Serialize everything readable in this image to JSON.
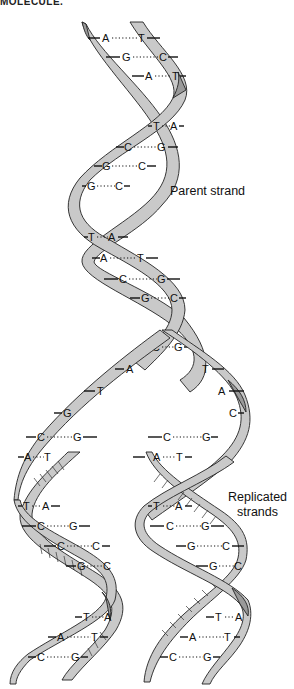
{
  "caption": "MOLECULE.",
  "labels": {
    "parent": "Parent strand",
    "replicated_line1": "Replicated",
    "replicated_line2": "strands"
  },
  "parent_pairs": [
    {
      "left": "A",
      "right": "T"
    },
    {
      "left": "G",
      "right": "C"
    },
    {
      "left": "A",
      "right": "T"
    },
    {
      "left": "T",
      "right": "A"
    },
    {
      "left": "C",
      "right": "G"
    },
    {
      "left": "G",
      "right": "C"
    },
    {
      "left": "G",
      "right": "C"
    },
    {
      "left": "T",
      "right": "A"
    },
    {
      "left": "A",
      "right": "T"
    },
    {
      "left": "C",
      "right": "G"
    },
    {
      "left": "G",
      "right": "C"
    },
    {
      "left": "C",
      "right": "G"
    }
  ],
  "unpaired_left": [
    "A",
    "T",
    "G"
  ],
  "unpaired_right": [
    "T",
    "A",
    "C"
  ],
  "fork_pairs": {
    "left": {
      "left": "C",
      "right": "G"
    },
    "right": {
      "left": "C",
      "right": "G"
    }
  },
  "daughter_left_pairs": [
    {
      "left": "A",
      "right": "T"
    },
    {
      "left": "T",
      "right": "A"
    },
    {
      "left": "C",
      "right": "G"
    },
    {
      "left": "C",
      "right": "C"
    },
    {
      "left": "G",
      "right": "C"
    },
    {
      "left": "T",
      "right": "A"
    },
    {
      "left": "A",
      "right": "T"
    },
    {
      "left": "C",
      "right": "G"
    }
  ],
  "daughter_right_pairs": [
    {
      "left": "A",
      "right": "T"
    },
    {
      "left": "T",
      "right": "A"
    },
    {
      "left": "C",
      "right": "G"
    },
    {
      "left": "G",
      "right": "C"
    },
    {
      "left": "G",
      "right": "C"
    },
    {
      "left": "T",
      "right": "A"
    },
    {
      "left": "A",
      "right": "T"
    },
    {
      "left": "C",
      "right": "G"
    }
  ],
  "colors": {
    "ribbon": "#c9c9c9",
    "ribbon_shade": "#9a9a9a",
    "ink": "#111111"
  }
}
